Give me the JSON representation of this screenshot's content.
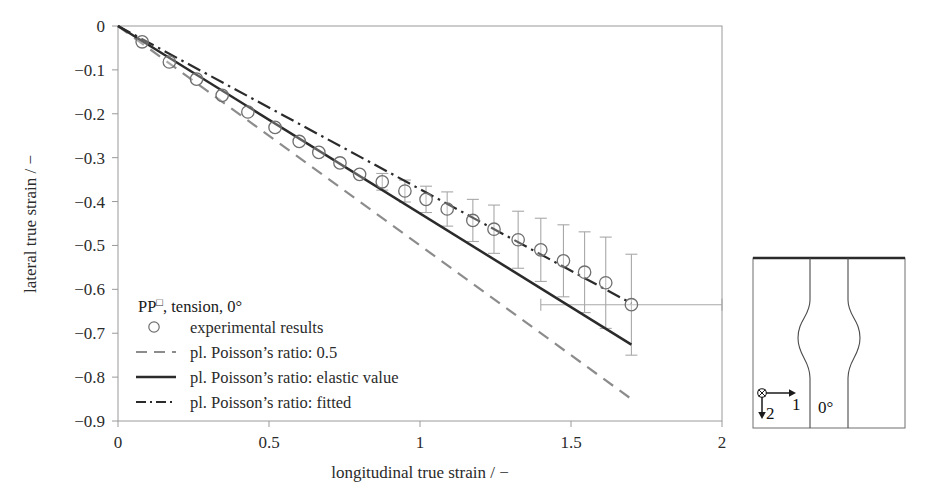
{
  "figure": {
    "name": "lateral-vs-longitudinal-true-strain-plot"
  },
  "axes": {
    "x_title": "longitudinal true strain / −",
    "y_title": "lateral true strain / −",
    "x_ticks": [
      "0",
      "0.5",
      "1",
      "1.5",
      "2"
    ],
    "y_ticks": [
      "0",
      "−0.1",
      "−0.2",
      "−0.3",
      "−0.4",
      "−0.5",
      "−0.6",
      "−0.7",
      "−0.8",
      "−0.9"
    ]
  },
  "legend": {
    "header_main": "PP",
    "header_sup": "□",
    "header_rest": ", tension, 0°",
    "items": [
      {
        "marker": "circle",
        "label": "experimental results"
      },
      {
        "marker": "dashed-line",
        "label": "pl. Poisson’s ratio: 0.5"
      },
      {
        "marker": "solid-line",
        "label": "pl. Poisson’s ratio: elastic value"
      },
      {
        "marker": "dashdot-line",
        "label": "pl. Poisson’s ratio: fitted"
      }
    ]
  },
  "specimen": {
    "angle_label": "0°",
    "axis1_label": "1",
    "axis2_label": "2",
    "origin_symbol": "⊕"
  },
  "colors": {
    "frame": "#9a9a9a",
    "solid_line": "#2b2b2b",
    "dashed_line": "#8c8c8c",
    "dashdot_line": "#2b2b2b",
    "marker_edge": "#6e6e6e",
    "errorbar": "#a8a8a8",
    "specimen_outline": "#3a3a3a",
    "text": "#2b2b2b"
  },
  "chart_data": {
    "type": "scatter",
    "title": "",
    "xlabel": "longitudinal true strain / −",
    "ylabel": "lateral true strain / −",
    "xlim": [
      0,
      2
    ],
    "ylim": [
      -0.9,
      0
    ],
    "xticks": [
      0,
      0.5,
      1,
      1.5,
      2
    ],
    "yticks": [
      0,
      -0.1,
      -0.2,
      -0.3,
      -0.4,
      -0.5,
      -0.6,
      -0.7,
      -0.8,
      -0.9
    ],
    "grid": false,
    "legend_position": "lower-left-inside",
    "series": [
      {
        "name": "experimental results",
        "type": "scatter",
        "marker": "open-circle",
        "x": [
          0.08,
          0.17,
          0.26,
          0.345,
          0.43,
          0.52,
          0.6,
          0.665,
          0.735,
          0.8,
          0.875,
          0.95,
          1.02,
          1.09,
          1.175,
          1.245,
          1.325,
          1.4,
          1.475,
          1.545,
          1.615,
          1.7
        ],
        "y": [
          -0.036,
          -0.082,
          -0.121,
          -0.158,
          -0.196,
          -0.231,
          -0.263,
          -0.288,
          -0.312,
          -0.338,
          -0.355,
          -0.376,
          -0.395,
          -0.417,
          -0.443,
          -0.463,
          -0.487,
          -0.51,
          -0.535,
          -0.561,
          -0.585,
          -0.635
        ],
        "yerr": [
          0.0,
          0.0,
          0.0,
          0.0,
          0.0,
          0.0,
          0.0,
          0.0,
          0.0,
          0.0,
          0.019,
          0.025,
          0.03,
          0.039,
          0.048,
          0.055,
          0.065,
          0.072,
          0.082,
          0.092,
          0.104,
          0.115
        ],
        "xerr": [
          0,
          0,
          0,
          0,
          0,
          0,
          0,
          0,
          0,
          0,
          0,
          0,
          0,
          0,
          0,
          0,
          0,
          0,
          0,
          0,
          0,
          0.3
        ]
      },
      {
        "name": "pl. Poisson's ratio: 0.5",
        "type": "line",
        "style": "dashed",
        "x": [
          0,
          1.7
        ],
        "y": [
          0,
          -0.85
        ],
        "slope": -0.5
      },
      {
        "name": "pl. Poisson's ratio: elastic value",
        "type": "line",
        "style": "solid",
        "x": [
          0,
          1.7
        ],
        "y": [
          0,
          -0.726
        ],
        "slope": -0.427
      },
      {
        "name": "pl. Poisson's ratio: fitted",
        "type": "line",
        "style": "dashdot",
        "x": [
          0,
          1.7
        ],
        "y": [
          0,
          -0.632
        ],
        "slope": -0.372
      }
    ]
  }
}
